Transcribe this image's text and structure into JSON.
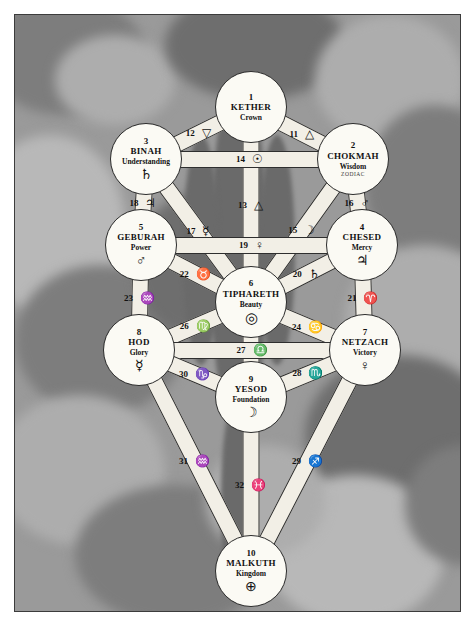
{
  "diagram": {
    "background_color": "#9a9a9a",
    "node_fill": "#fbfaf4",
    "path_fill": "#f2efe6",
    "ink_color": "#111111"
  },
  "sephiroth": [
    {
      "number": "1",
      "name": "KETHER",
      "title": "Crown",
      "symbol": "",
      "subtext": "",
      "cx": 236,
      "cy": 92,
      "r": 36
    },
    {
      "number": "2",
      "name": "CHOKMAH",
      "title": "Wisdom",
      "symbol": "",
      "subtext": "ZODIAC",
      "cx": 338,
      "cy": 144,
      "r": 36
    },
    {
      "number": "3",
      "name": "BINAH",
      "title": "Understanding",
      "symbol": "♄",
      "subtext": "",
      "cx": 131,
      "cy": 144,
      "r": 36
    },
    {
      "number": "4",
      "name": "CHESED",
      "title": "Mercy",
      "symbol": "♃",
      "subtext": "",
      "cx": 347,
      "cy": 230,
      "r": 36
    },
    {
      "number": "5",
      "name": "GEBURAH",
      "title": "Power",
      "symbol": "♂",
      "subtext": "",
      "cx": 126,
      "cy": 230,
      "r": 36
    },
    {
      "number": "6",
      "name": "TIPHARETH",
      "title": "Beauty",
      "symbol": "◎",
      "subtext": "",
      "cx": 236,
      "cy": 287,
      "r": 36
    },
    {
      "number": "7",
      "name": "NETZACH",
      "title": "Victory",
      "symbol": "♀",
      "subtext": "",
      "cx": 350,
      "cy": 335,
      "r": 36
    },
    {
      "number": "8",
      "name": "HOD",
      "title": "Glory",
      "symbol": "☿",
      "subtext": "",
      "cx": 124,
      "cy": 335,
      "r": 36
    },
    {
      "number": "9",
      "name": "YESOD",
      "title": "Foundation",
      "symbol": "☽",
      "subtext": "",
      "cx": 236,
      "cy": 382,
      "r": 36
    },
    {
      "number": "10",
      "name": "MALKUTH",
      "title": "Kingdom",
      "symbol": "⊕",
      "subtext": "",
      "cx": 236,
      "cy": 556,
      "r": 36
    }
  ],
  "paths": [
    {
      "number": "11",
      "symbol": "△",
      "from": "1",
      "to": "2",
      "label": "Kether-Chokmah"
    },
    {
      "number": "12",
      "symbol": "▽",
      "from": "1",
      "to": "3",
      "label": "Kether-Binah"
    },
    {
      "number": "13",
      "symbol": "△",
      "from": "1",
      "to": "6",
      "label": "Kether-Tiphareth"
    },
    {
      "number": "14",
      "symbol": "☉",
      "from": "3",
      "to": "2",
      "label": "Binah-Chokmah"
    },
    {
      "number": "15",
      "symbol": "☽",
      "from": "2",
      "to": "6",
      "label": "Chokmah-Tiphareth"
    },
    {
      "number": "16",
      "symbol": "♂",
      "from": "2",
      "to": "4",
      "label": "Chokmah-Chesed"
    },
    {
      "number": "17",
      "symbol": "☿",
      "from": "3",
      "to": "6",
      "label": "Binah-Tiphareth"
    },
    {
      "number": "18",
      "symbol": "♃",
      "from": "3",
      "to": "5",
      "label": "Binah-Geburah"
    },
    {
      "number": "19",
      "symbol": "♀",
      "from": "5",
      "to": "4",
      "label": "Geburah-Chesed"
    },
    {
      "number": "20",
      "symbol": "♄",
      "from": "4",
      "to": "6",
      "label": "Chesed-Tiphareth"
    },
    {
      "number": "21",
      "symbol": "♈",
      "from": "4",
      "to": "7",
      "label": "Chesed-Netzach"
    },
    {
      "number": "22",
      "symbol": "♉",
      "from": "5",
      "to": "6",
      "label": "Geburah-Tiphareth"
    },
    {
      "number": "23",
      "symbol": "♒",
      "from": "5",
      "to": "8",
      "label": "Geburah-Hod"
    },
    {
      "number": "24",
      "symbol": "♋",
      "from": "6",
      "to": "7",
      "label": "Tiphareth-Netzach"
    },
    {
      "number": "25",
      "symbol": "♐",
      "from": "6",
      "to": "9",
      "label": "Tiphareth-Yesod"
    },
    {
      "number": "26",
      "symbol": "♍",
      "from": "6",
      "to": "8",
      "label": "Tiphareth-Hod"
    },
    {
      "number": "27",
      "symbol": "♎",
      "from": "8",
      "to": "7",
      "label": "Hod-Netzach"
    },
    {
      "number": "28",
      "symbol": "♏",
      "from": "7",
      "to": "9",
      "label": "Netzach-Yesod"
    },
    {
      "number": "29",
      "symbol": "♐",
      "from": "7",
      "to": "10",
      "label": "Netzach-Malkuth"
    },
    {
      "number": "30",
      "symbol": "♑",
      "from": "8",
      "to": "9",
      "label": "Hod-Yesod"
    },
    {
      "number": "31",
      "symbol": "♒",
      "from": "8",
      "to": "10",
      "label": "Hod-Malkuth"
    },
    {
      "number": "32",
      "symbol": "♓",
      "from": "9",
      "to": "10",
      "label": "Yesod-Malkuth"
    }
  ]
}
